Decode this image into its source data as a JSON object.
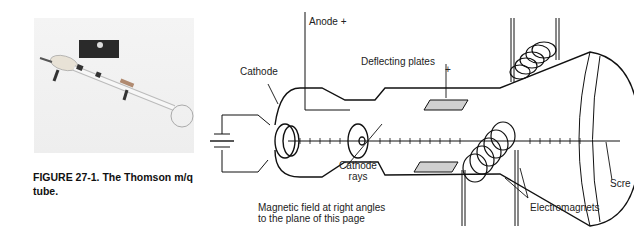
{
  "figure": {
    "caption": "FIGURE 27-1. The Thomson m/q tube.",
    "photo_alt": "photograph of Thomson tube apparatus"
  },
  "diagram": {
    "labels": {
      "anode": "Anode +",
      "cathode": "Cathode",
      "deflecting_plates": "Deflecting plates",
      "plus": "+",
      "cathode_rays_line1": "Cathode",
      "cathode_rays_line2": "rays",
      "magnetic_field_line1": "Magnetic field at right angles",
      "magnetic_field_line2": "to the plane of this page",
      "electromagnets": "Electromagnets",
      "screen": "Scre"
    }
  }
}
